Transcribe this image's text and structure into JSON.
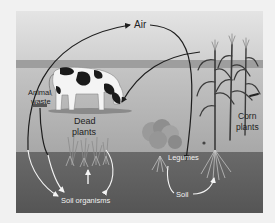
{
  "labels": {
    "air": "Air",
    "animal_waste_1": "Animal",
    "animal_waste_2": "waste",
    "dead_plants_1": "Dead",
    "dead_plants_2": "plants",
    "corn_plants_1": "Corn",
    "corn_plants_2": "plants",
    "legumes": "Legumes",
    "soil": "Soil",
    "soil_organisms": "Soil organisms"
  },
  "colors": {
    "page_bg": "#f1f1f1",
    "sky_top": "#e2e2e2",
    "sky_bottom": "#d2d2d2",
    "horizon_band": "#9c9c9c",
    "field": "#bcbcbc",
    "soil": "#5f5f5f",
    "dark_arrow": "#1e1e1e",
    "light_arrow": "#f4f4f4",
    "dark_text": "#222222",
    "light_text": "#f2f2f2"
  }
}
